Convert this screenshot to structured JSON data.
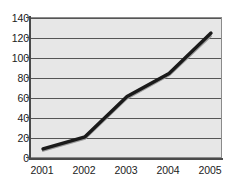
{
  "chart_data": {
    "type": "line",
    "title": "",
    "subtitle": "",
    "xlabel": "",
    "ylabel": "",
    "categories": [
      "2001",
      "2002",
      "2003",
      "2004",
      "2005"
    ],
    "x": [
      2001,
      2002,
      2003,
      2004,
      2005
    ],
    "series": [
      {
        "name": "data-line",
        "values": [
          10,
          22,
          62,
          85,
          125
        ],
        "color": "#1a1a1a",
        "style": "thick-solid"
      },
      {
        "name": "trendline",
        "values": [
          8,
          20,
          60,
          83,
          122
        ],
        "color": "#9a9a9a",
        "style": "thin-solid"
      }
    ],
    "ylim": [
      0,
      140
    ],
    "yticks": [
      0,
      20,
      40,
      60,
      80,
      100,
      120,
      140
    ],
    "ytick_labels": [
      "0",
      "20",
      "40",
      "60",
      "80",
      "100",
      "120",
      "140"
    ],
    "xtick_labels": [
      "2001",
      "2002",
      "2003",
      "2004",
      "2005"
    ],
    "grid": true,
    "grid_axis": "horizontal",
    "grid_color": "#555555",
    "legend": false,
    "legend_position": "none",
    "plot_background": "#e7e7e7",
    "plot_border_color": "#8b8b8b",
    "axis_color": "#4a4a4a",
    "page_background": "#ffffff"
  }
}
